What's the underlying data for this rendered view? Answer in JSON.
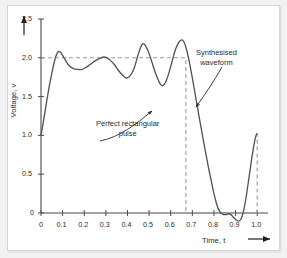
{
  "chart_data": {
    "type": "line",
    "title": "",
    "xlabel": "Time, t",
    "ylabel": "Voltage, v",
    "xlim": [
      0,
      1.05
    ],
    "ylim": [
      -0.18,
      2.55
    ],
    "grid": false,
    "legend_position": "none",
    "x_ticks": [
      "0",
      "0.1",
      "0.2",
      "0.3",
      "0.4",
      "0.5",
      "0.6",
      "0.7",
      "0.8",
      "0.9",
      "1.0"
    ],
    "x_tick_values": [
      0,
      0.1,
      0.2,
      0.3,
      0.4,
      0.5,
      0.6,
      0.7,
      0.8,
      0.9,
      1.0
    ],
    "y_ticks": [
      "0",
      "0.5",
      "1.0",
      "1.5",
      "2.0",
      "2.5"
    ],
    "y_tick_values": [
      0,
      0.5,
      1.0,
      1.5,
      2.0,
      2.5
    ],
    "series": [
      {
        "name": "Synthesised waveform",
        "style": "solid",
        "color": "#555555",
        "description": "Fourier partial sum approximation of a rectangular pulse of amplitude 2 over 0 to 0.67, showing Gibbs ringing",
        "points": [
          [
            0.0,
            1.0
          ],
          [
            0.01,
            1.16
          ],
          [
            0.02,
            1.33
          ],
          [
            0.03,
            1.5
          ],
          [
            0.04,
            1.66
          ],
          [
            0.05,
            1.8
          ],
          [
            0.06,
            1.93
          ],
          [
            0.07,
            2.03
          ],
          [
            0.08,
            2.08
          ],
          [
            0.09,
            2.07
          ],
          [
            0.1,
            2.03
          ],
          [
            0.115,
            1.96
          ],
          [
            0.13,
            1.9
          ],
          [
            0.15,
            1.86
          ],
          [
            0.17,
            1.85
          ],
          [
            0.19,
            1.85
          ],
          [
            0.21,
            1.88
          ],
          [
            0.23,
            1.92
          ],
          [
            0.25,
            1.96
          ],
          [
            0.27,
            1.99
          ],
          [
            0.29,
            2.01
          ],
          [
            0.305,
            2.0
          ],
          [
            0.32,
            1.97
          ],
          [
            0.34,
            1.91
          ],
          [
            0.36,
            1.83
          ],
          [
            0.38,
            1.77
          ],
          [
            0.395,
            1.74
          ],
          [
            0.41,
            1.76
          ],
          [
            0.43,
            1.86
          ],
          [
            0.445,
            2.0
          ],
          [
            0.46,
            2.13
          ],
          [
            0.47,
            2.18
          ],
          [
            0.48,
            2.17
          ],
          [
            0.495,
            2.09
          ],
          [
            0.51,
            1.97
          ],
          [
            0.525,
            1.84
          ],
          [
            0.54,
            1.73
          ],
          [
            0.552,
            1.66
          ],
          [
            0.562,
            1.64
          ],
          [
            0.575,
            1.68
          ],
          [
            0.59,
            1.79
          ],
          [
            0.605,
            1.94
          ],
          [
            0.62,
            2.09
          ],
          [
            0.635,
            2.19
          ],
          [
            0.65,
            2.23
          ],
          [
            0.66,
            2.21
          ],
          [
            0.672,
            2.12
          ],
          [
            0.685,
            1.96
          ],
          [
            0.7,
            1.74
          ],
          [
            0.715,
            1.5
          ],
          [
            0.73,
            1.26
          ],
          [
            0.745,
            1.03
          ],
          [
            0.76,
            0.8
          ],
          [
            0.775,
            0.58
          ],
          [
            0.79,
            0.38
          ],
          [
            0.8,
            0.25
          ],
          [
            0.812,
            0.12
          ],
          [
            0.822,
            0.04
          ],
          [
            0.832,
            0.0
          ],
          [
            0.845,
            -0.02
          ],
          [
            0.858,
            -0.02
          ],
          [
            0.87,
            -0.01
          ],
          [
            0.882,
            -0.03
          ],
          [
            0.895,
            -0.07
          ],
          [
            0.908,
            -0.1
          ],
          [
            0.918,
            -0.1
          ],
          [
            0.928,
            -0.06
          ],
          [
            0.938,
            0.04
          ],
          [
            0.948,
            0.19
          ],
          [
            0.958,
            0.38
          ],
          [
            0.968,
            0.57
          ],
          [
            0.978,
            0.76
          ],
          [
            0.988,
            0.92
          ],
          [
            0.996,
            1.01
          ],
          [
            1.0,
            1.02
          ]
        ]
      },
      {
        "name": "Perfect rectangular pulse",
        "style": "dashed",
        "color": "#9a9a9a",
        "description": "Ideal rectangle: level 2.0 from t=0 to t=0.67, dropping to 0, with boundary at t=1.0",
        "points": [
          [
            0.0,
            2.0
          ],
          [
            0.67,
            2.0
          ],
          [
            0.67,
            0.0
          ],
          [
            1.0,
            0.0
          ],
          [
            1.0,
            1.02
          ]
        ]
      }
    ],
    "annotations": [
      {
        "name": "perfect-rectangular-pulse",
        "line1": "Perfect rectangular",
        "line2": "pulse"
      },
      {
        "name": "synthesised-waveform",
        "line1": "Synthesised",
        "line2": "waveform"
      }
    ]
  },
  "axes": {
    "x_axis_label": "Time, t",
    "y_axis_label": "Voltage, v"
  },
  "colors": {
    "waveform": "#555555",
    "dashed": "#9a9a9a",
    "axis": "#4a4a4a",
    "text": "#2b2b2b",
    "panel": "#ffffff",
    "background": "#f2f2f2"
  }
}
